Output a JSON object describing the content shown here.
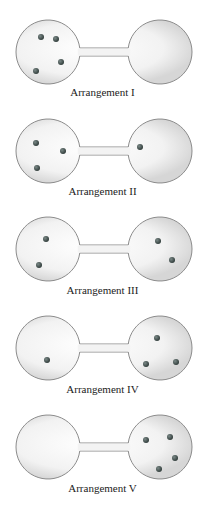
{
  "colors": {
    "bulb_fill_center": "#ffffff",
    "bulb_fill_edge": "#dcdcdc",
    "bulb_stroke": "#8c8c8c",
    "particle": "#3a4a48",
    "label": "#222222"
  },
  "arrangements": [
    {
      "label": "Arrangement I",
      "cy": 52,
      "label_y": 96,
      "particles": [
        [
          41,
          37
        ],
        [
          56,
          39
        ],
        [
          61,
          62
        ],
        [
          36,
          71
        ]
      ]
    },
    {
      "label": "Arrangement II",
      "cy": 151,
      "label_y": 195,
      "particles": [
        [
          36,
          143
        ],
        [
          63,
          151
        ],
        [
          37,
          168
        ],
        [
          140,
          147
        ]
      ]
    },
    {
      "label": "Arrangement III",
      "cy": 249,
      "label_y": 294,
      "particles": [
        [
          46,
          239
        ],
        [
          39,
          265
        ],
        [
          158,
          241
        ],
        [
          172,
          260
        ]
      ]
    },
    {
      "label": "Arrangement IV",
      "cy": 348,
      "label_y": 393,
      "particles": [
        [
          47,
          360
        ],
        [
          157,
          338
        ],
        [
          146,
          364
        ],
        [
          176,
          362
        ]
      ]
    },
    {
      "label": "Arrangement V",
      "cy": 447,
      "label_y": 492,
      "particles": [
        [
          146,
          440
        ],
        [
          170,
          437
        ],
        [
          175,
          458
        ],
        [
          159,
          469
        ]
      ]
    }
  ]
}
